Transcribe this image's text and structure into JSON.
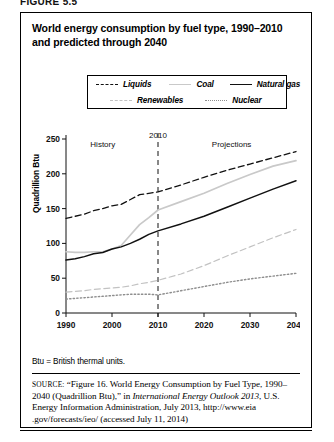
{
  "figure_caption": "FIGURE 5.5",
  "figure": {
    "title": "World energy consumption by fuel type, 1990–2010 and predicted through 2040"
  },
  "legend": {
    "items": [
      {
        "label": "Liquids",
        "style": "dashed",
        "color": "#111111",
        "icon": "line-dashed-icon"
      },
      {
        "label": "Coal",
        "style": "solid-light",
        "color": "#c9c9c9",
        "icon": "line-solid-light-icon"
      },
      {
        "label": "Natural gas",
        "style": "solid",
        "color": "#111111",
        "icon": "line-solid-icon"
      },
      {
        "label": "Renewables",
        "style": "dashed-light",
        "color": "#c2c2c2",
        "icon": "line-dashed-light-icon"
      },
      {
        "label": "Nuclear",
        "style": "dotted",
        "color": "#8e8e8e",
        "icon": "line-dotted-icon"
      }
    ]
  },
  "notes": {
    "btu": "Btu = British thermal units."
  },
  "source": {
    "label": "SOURCE:",
    "line1": "“Figure 16. World Energy Consumption by Fuel Type,",
    "line2_a": "1990–2040 (Quadrillion Btu),” in ",
    "line2_italic": "International Energy Outlook 2013",
    "line2_b": ",",
    "line3": "U.S. Energy Information Administration, July 2013, http://www.eia",
    "line4": ".gov/forecasts/ieo/ (accessed July 11, 2014)"
  },
  "chart_data": {
    "type": "line",
    "title": "World energy consumption by fuel type, 1990–2010 and predicted through 2040",
    "xlabel": "",
    "ylabel": "Quadrillion Btu",
    "xlim": [
      1990,
      2040
    ],
    "ylim": [
      0,
      250
    ],
    "yticks": [
      0,
      50,
      100,
      150,
      200,
      250
    ],
    "xticks": [
      1990,
      2000,
      2010,
      2020,
      2030,
      2040
    ],
    "grid": false,
    "legend_position": "top-center",
    "annotations": [
      {
        "text": "History",
        "x": 1998,
        "y": 238
      },
      {
        "text": "Projections",
        "x": 2026,
        "y": 238
      },
      {
        "text": "2010",
        "x": 2010,
        "y": 252
      }
    ],
    "divider_x": 2010,
    "x": [
      1990,
      1992,
      1994,
      1996,
      1998,
      2000,
      2002,
      2004,
      2006,
      2008,
      2010,
      2015,
      2020,
      2025,
      2030,
      2035,
      2040
    ],
    "series": [
      {
        "name": "Liquids",
        "style": "dashed",
        "color": "#111111",
        "values": [
          136,
          139,
          142,
          147,
          150,
          154,
          156,
          163,
          170,
          172,
          174,
          184,
          195,
          205,
          214,
          223,
          232
        ]
      },
      {
        "name": "Coal",
        "style": "solid-light",
        "color": "#c9c9c9",
        "values": [
          88,
          87,
          87,
          88,
          88,
          92,
          97,
          112,
          127,
          137,
          148,
          160,
          172,
          186,
          199,
          211,
          219
        ]
      },
      {
        "name": "Natural gas",
        "style": "solid",
        "color": "#111111",
        "values": [
          76,
          78,
          81,
          85,
          87,
          92,
          95,
          100,
          106,
          113,
          118,
          128,
          139,
          152,
          165,
          178,
          190
        ]
      },
      {
        "name": "Renewables",
        "style": "dashed-light",
        "color": "#c2c2c2",
        "values": [
          30,
          31,
          32,
          34,
          35,
          36,
          37,
          39,
          42,
          44,
          47,
          56,
          68,
          82,
          95,
          108,
          120
        ]
      },
      {
        "name": "Nuclear",
        "style": "dotted",
        "color": "#8e8e8e",
        "values": [
          20,
          21,
          22,
          23,
          24,
          25,
          26,
          27,
          27,
          27,
          26,
          32,
          38,
          44,
          49,
          53,
          57
        ]
      }
    ]
  }
}
